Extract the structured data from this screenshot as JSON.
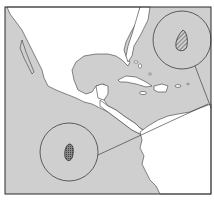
{
  "map": {
    "title": "",
    "region": "Gulf of Mexico, Caribbean and Central America",
    "colors": {
      "ocean": "#cfcfcf",
      "land": "#ffffff",
      "outline": "#3a3a3a",
      "frame": "#2a2a2a"
    },
    "insets": [
      {
        "name": "inset-atlantic",
        "cx": 182,
        "cy": 40,
        "r": 29,
        "marker": "hatched-teardrop"
      },
      {
        "name": "inset-pacific",
        "cx": 69,
        "cy": 152,
        "r": 29,
        "marker": "stippled-oval"
      }
    ]
  }
}
